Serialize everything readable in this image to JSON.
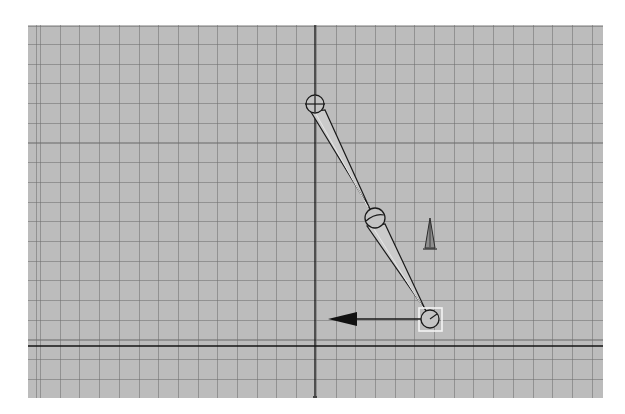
{
  "viewport": {
    "type": "3d-orthographic-viewport",
    "background_color": "#bcbcbc",
    "grid_line_color": "#7a7a7a",
    "axis_color": "#111111",
    "grid_spacing_px": 19.7
  },
  "axes": {
    "origin": {
      "x": 315,
      "y": 346
    }
  },
  "joint_chain": {
    "joints": [
      {
        "name": "joint1",
        "x": 315,
        "y": 104,
        "r": 9
      },
      {
        "name": "joint2",
        "x": 375,
        "y": 218,
        "r": 10
      },
      {
        "name": "joint3",
        "x": 430,
        "y": 319,
        "r": 9,
        "selected": true
      }
    ],
    "bones": [
      {
        "from": 0,
        "to": 1
      },
      {
        "from": 1,
        "to": 2
      }
    ]
  },
  "manipulator": {
    "type": "move-arrow",
    "direction": "left",
    "from": {
      "x": 420,
      "y": 319
    },
    "to": {
      "x": 330,
      "y": 319
    }
  },
  "pole_vector": {
    "icon": "pole-vector-icon",
    "x": 430,
    "y": 233
  },
  "colors": {
    "selection": "#f4f4f4",
    "outline": "#1a1a1a",
    "bone_fill": "#cfcfcf"
  }
}
